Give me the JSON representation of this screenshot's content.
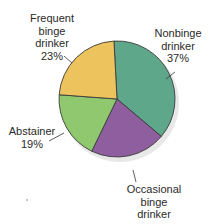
{
  "chart_data": {
    "type": "pie",
    "title": "",
    "start_angle_deg": -3,
    "direction": "clockwise",
    "categories": [
      "Nonbinge drinker",
      "Occasional binge drinker",
      "Abstainer",
      "Frequent binge drinker"
    ],
    "values": [
      37,
      21,
      19,
      23
    ],
    "unit": "%",
    "colors": [
      "#5fa78a",
      "#8e5e9e",
      "#90c870",
      "#edc35e"
    ],
    "labels": [
      {
        "lines": [
          "Nonbinge",
          "drinker",
          "37%"
        ]
      },
      {
        "lines": [
          "Occasional",
          "binge",
          "drinker",
          "21%"
        ]
      },
      {
        "lines": [
          "Abstainer",
          "19%"
        ]
      },
      {
        "lines": [
          "Frequent",
          "binge",
          "drinker",
          "23%"
        ]
      }
    ],
    "legend": "none (direct labels with leader lines)"
  },
  "style": {
    "outline_color": "#3a3a3a",
    "shadow_color": "#d9d9d9"
  }
}
